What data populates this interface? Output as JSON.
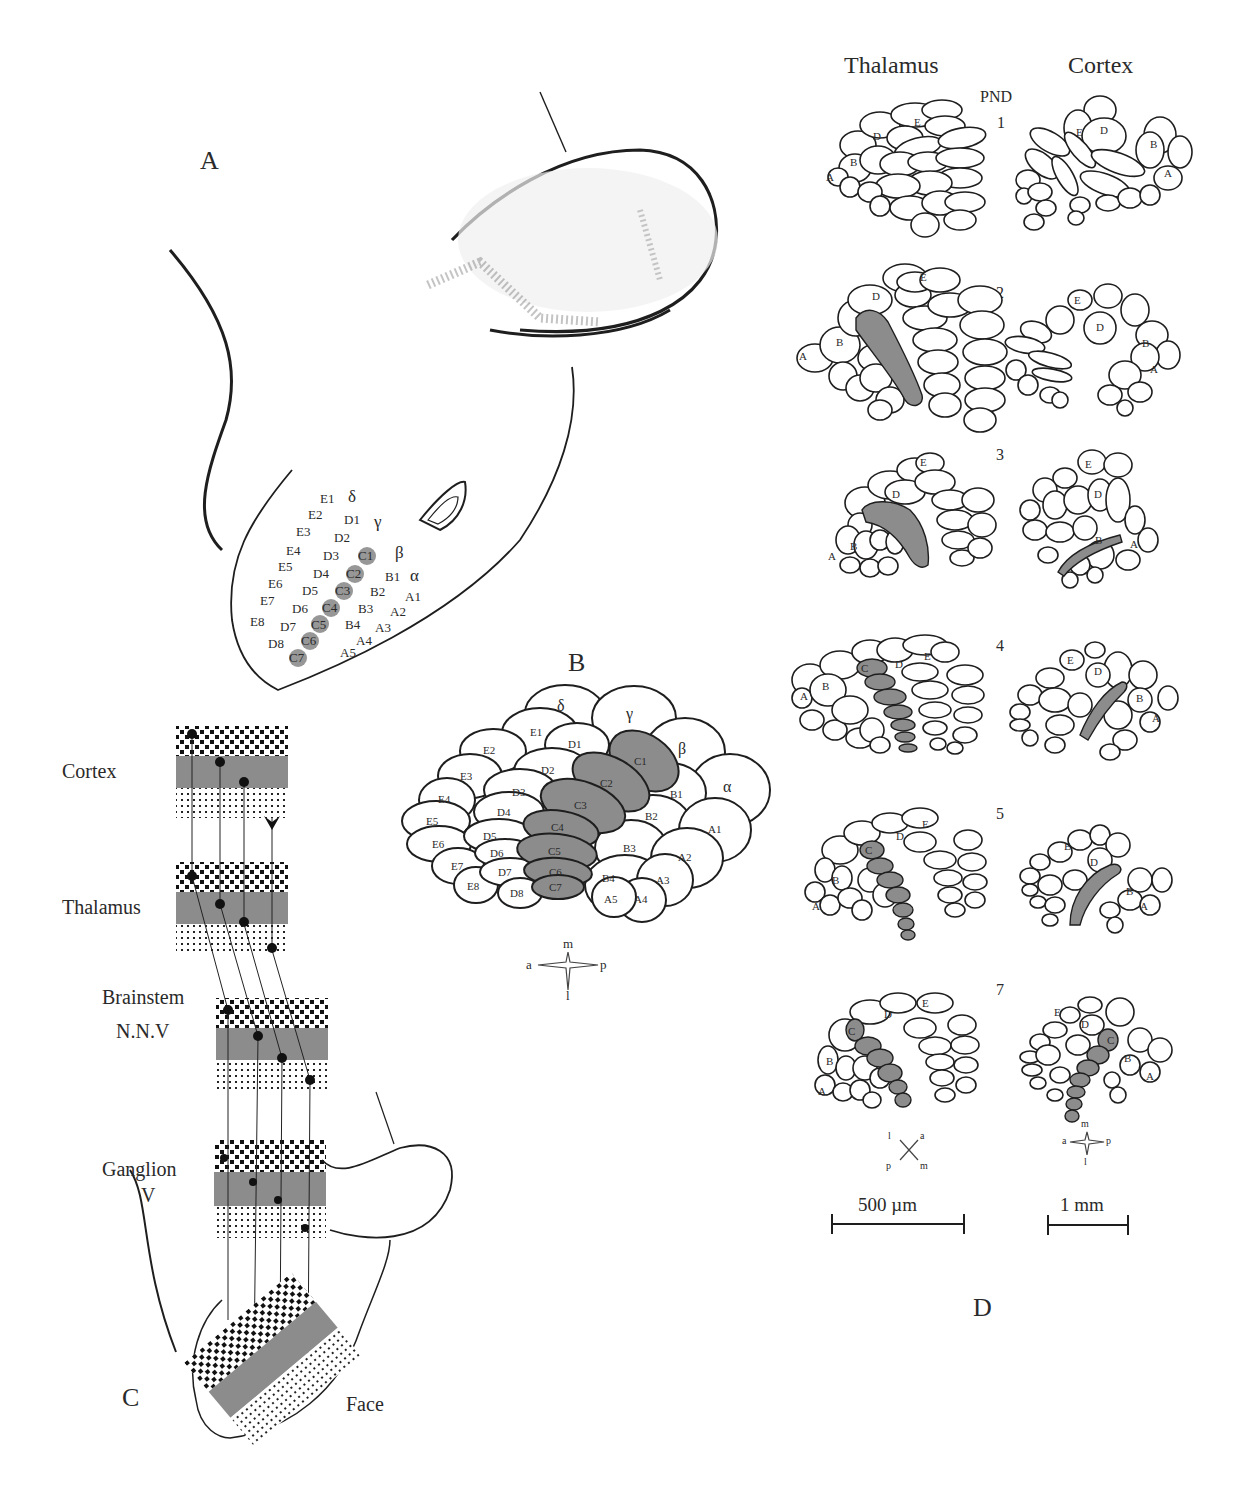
{
  "panels": {
    "A": {
      "label": "A",
      "whisker_rows": {
        "straddlers": [
          "δ",
          "γ",
          "β",
          "α"
        ],
        "E": [
          "E1",
          "E2",
          "E3",
          "E4",
          "E5",
          "E6",
          "E7",
          "E8"
        ],
        "D": [
          "D1",
          "D2",
          "D3",
          "D4",
          "D5",
          "D6",
          "D7",
          "D8"
        ],
        "C": [
          "C1",
          "C2",
          "C3",
          "C4",
          "C5",
          "C6",
          "C7"
        ],
        "B": [
          "B1",
          "B2",
          "B3",
          "B4"
        ],
        "A": [
          "A1",
          "A2",
          "A3",
          "A4",
          "A5"
        ]
      },
      "highlighted_row": "C"
    },
    "B": {
      "label": "B",
      "barrels": [
        "δ",
        "γ",
        "β",
        "α",
        "E1",
        "E2",
        "E3",
        "E4",
        "E5",
        "E6",
        "E7",
        "E8",
        "D1",
        "D2",
        "D3",
        "D4",
        "D5",
        "D6",
        "D7",
        "D8",
        "C1",
        "C2",
        "C3",
        "C4",
        "C5",
        "C6",
        "C7",
        "B1",
        "B2",
        "B3",
        "B4",
        "A1",
        "A2",
        "A3",
        "A4",
        "A5"
      ],
      "highlighted": [
        "C1",
        "C2",
        "C3",
        "C4",
        "C5",
        "C6",
        "C7"
      ],
      "compass": {
        "top": "m",
        "left": "a",
        "right": "p",
        "bottom": "l"
      }
    },
    "C": {
      "label": "C",
      "levels": [
        "Cortex",
        "Thalamus",
        "Brainstem",
        "N.N.V",
        "Ganglion",
        "V",
        "Face"
      ]
    },
    "D": {
      "label": "D",
      "column_headers": {
        "left": "Thalamus",
        "center": "PND",
        "right": "Cortex"
      },
      "ages": [
        "1",
        "2",
        "3",
        "4",
        "5",
        "7"
      ],
      "row_labels": {
        "A": "A",
        "B": "B",
        "C": "C",
        "D": "D",
        "E": "E"
      },
      "thalamus_compass": {
        "tl": "l",
        "tr": "a",
        "bl": "p",
        "br": "m"
      },
      "cortex_compass": {
        "top": "m",
        "left": "a",
        "right": "p",
        "bottom": "l"
      },
      "scale_bars": {
        "thalamus": "500 µm",
        "cortex": "1 mm"
      }
    }
  },
  "colors": {
    "line": "#1e1e1e",
    "highlight_fill": "#8c8c8c",
    "background": "#ffffff"
  }
}
